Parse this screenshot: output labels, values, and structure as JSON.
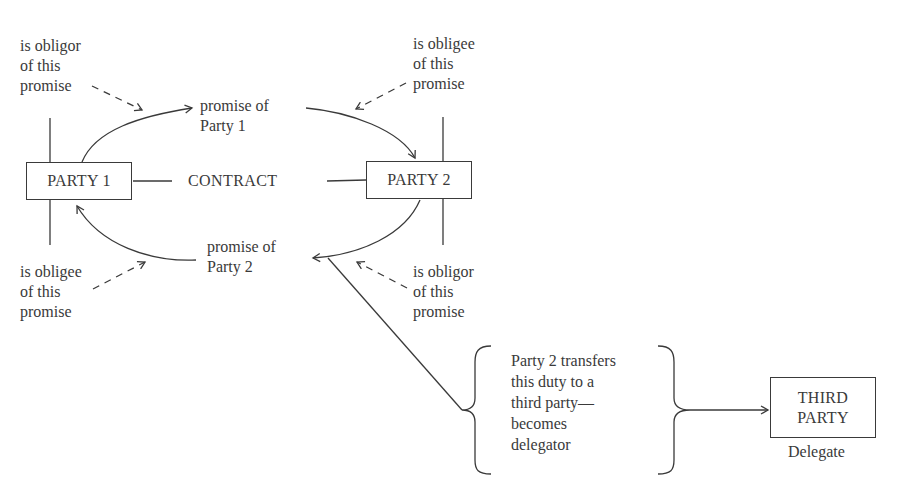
{
  "parties": {
    "party1": "PARTY 1",
    "party2": "PARTY 2",
    "third_party_line1": "THIRD",
    "third_party_line2": "PARTY"
  },
  "contract_label": "CONTRACT",
  "promises": {
    "party1": [
      "promise of",
      "Party 1"
    ],
    "party2": [
      "promise of",
      "Party 2"
    ]
  },
  "roles": {
    "top_left": [
      "is obligor",
      "of this",
      "promise"
    ],
    "top_right": [
      "is obligee",
      "of this",
      "promise"
    ],
    "bottom_left": [
      "is obligee",
      "of this",
      "promise"
    ],
    "bottom_right": [
      "is obligor",
      "of this",
      "promise"
    ]
  },
  "delegation": {
    "text": [
      "Party 2 transfers",
      "this duty to a",
      "third party—",
      "becomes",
      "delegator"
    ],
    "third_party_role": "Delegate"
  }
}
